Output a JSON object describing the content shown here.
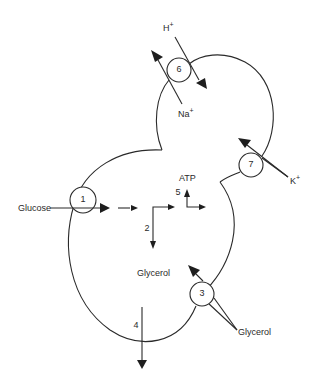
{
  "diagram": {
    "type": "cell transport schematic (budding yeast cell)",
    "labels": {
      "glucose_in": "Glucose",
      "glycerol_inside": "Glycerol",
      "glycerol_outside": "Glycerol",
      "atp": "ATP",
      "h_ion": "H",
      "na_ion": "Na",
      "k_ion": "K",
      "plus": "+"
    },
    "carriers": [
      {
        "id": "1",
        "label": "1",
        "role": "glucose uptake"
      },
      {
        "id": "3",
        "label": "3",
        "role": "glycerol uptake"
      },
      {
        "id": "6",
        "label": "6",
        "role": "Na+/H+ antiport"
      },
      {
        "id": "7",
        "label": "7",
        "role": "K+ uptake"
      }
    ],
    "pathways": [
      {
        "id": "2",
        "label": "2",
        "role": "glycolysis branch to glycerol"
      },
      {
        "id": "4",
        "label": "4",
        "role": "glycerol efflux"
      },
      {
        "id": "5",
        "label": "5",
        "role": "ATP production"
      }
    ],
    "colors": {
      "stroke": "#2a2a2a",
      "background": "#ffffff"
    }
  }
}
